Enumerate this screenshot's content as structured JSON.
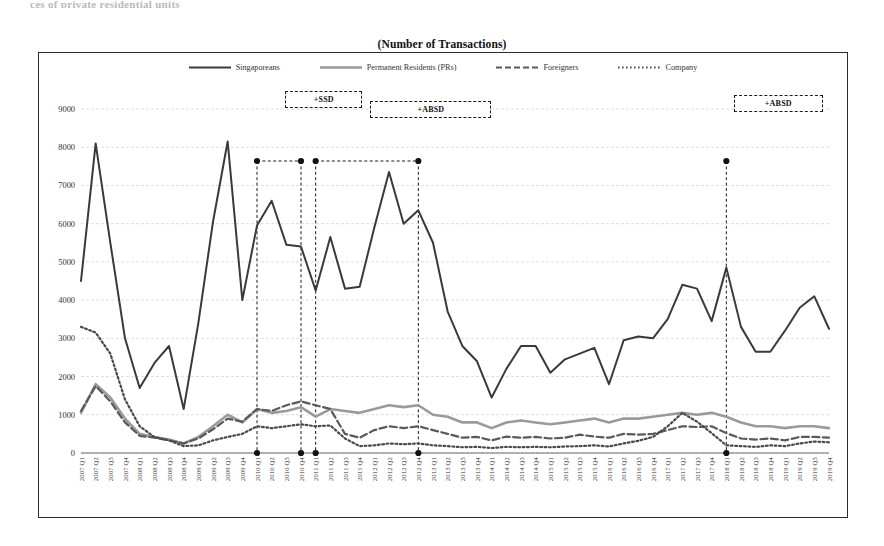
{
  "page": {
    "cut_top_text": "ces of private residential units",
    "title": "(Number of Transactions)"
  },
  "legend": [
    {
      "label": "Singaporeans",
      "style": "solid",
      "color": "#3a3a3a",
      "icon": "solid-line-swatch"
    },
    {
      "label": "Permanent Residents (PRs)",
      "style": "solid-light",
      "color": "#9a9a9a",
      "icon": "solid-line-swatch"
    },
    {
      "label": "Foreigners",
      "style": "dashed",
      "color": "#5a5a5a",
      "icon": "dashed-line-swatch"
    },
    {
      "label": "Company",
      "style": "dotted",
      "color": "#4a4a4a",
      "icon": "dotted-line-swatch"
    }
  ],
  "annotations": [
    {
      "label": "+SSD",
      "start_index": 12,
      "end_index": 15,
      "box_left_pct": 30.5,
      "box_width_pct": 9.5,
      "box_top": 38
    },
    {
      "label": "+ABSD",
      "start_index": 16,
      "end_index": 23,
      "box_left_pct": 41.0,
      "box_width_pct": 15.0,
      "box_top": 48
    },
    {
      "label": "+ABSD",
      "start_index": 44,
      "end_index": 44,
      "box_left_pct": 86.0,
      "box_width_pct": 11.0,
      "box_top": 42
    }
  ],
  "chart_data": {
    "type": "line",
    "title": "(Number of Transactions)",
    "xlabel": "",
    "ylabel": "",
    "ylim": [
      0,
      9000
    ],
    "yticks": [
      0,
      1000,
      2000,
      3000,
      4000,
      5000,
      6000,
      7000,
      8000,
      9000
    ],
    "grid": true,
    "legend_position": "top",
    "categories": [
      "2007 Q1",
      "2007 Q2",
      "2007 Q3",
      "2007 Q4",
      "2008 Q1",
      "2008 Q2",
      "2008 Q3",
      "2008 Q4",
      "2009 Q1",
      "2009 Q2",
      "2009 Q3",
      "2009 Q4",
      "2010 Q1",
      "2010 Q2",
      "2010 Q3",
      "2010 Q4",
      "2011 Q1",
      "2011 Q2",
      "2011 Q3",
      "2011 Q4",
      "2012 Q1",
      "2012 Q2",
      "2012 Q3",
      "2012 Q4",
      "2013 Q1",
      "2013 Q2",
      "2013 Q3",
      "2013 Q4",
      "2014 Q1",
      "2014 Q2",
      "2014 Q3",
      "2014 Q4",
      "2015 Q1",
      "2015 Q2",
      "2015 Q3",
      "2015 Q4",
      "2016 Q1",
      "2016 Q2",
      "2016 Q3",
      "2016 Q4",
      "2017 Q1",
      "2017 Q2",
      "2017 Q3",
      "2017 Q4",
      "2018 Q1",
      "2018 Q2",
      "2018 Q3",
      "2018 Q4",
      "2019 Q1",
      "2019 Q2",
      "2019 Q3",
      "2019 Q4"
    ],
    "series": [
      {
        "name": "Singaporeans",
        "color": "#3a3a3a",
        "style": "solid",
        "values": [
          4500,
          8100,
          5500,
          3000,
          1700,
          2350,
          2800,
          1150,
          3400,
          6050,
          8150,
          4000,
          5950,
          6600,
          5450,
          5400,
          4250,
          5650,
          4300,
          4350,
          5900,
          7350,
          6000,
          6350,
          5500,
          3700,
          2800,
          2400,
          1450,
          2200,
          2800,
          2800,
          2100,
          2450,
          2600,
          2750,
          1800,
          2950,
          3050,
          3000,
          3500,
          4400,
          4300,
          3450,
          4850,
          3300,
          2650,
          2650,
          3200,
          3800,
          4100,
          3250
        ]
      },
      {
        "name": "Permanent Residents (PRs)",
        "color": "#9a9a9a",
        "style": "solid-light",
        "values": [
          1050,
          1800,
          1450,
          900,
          500,
          420,
          350,
          250,
          420,
          700,
          1000,
          800,
          1150,
          1050,
          1100,
          1200,
          950,
          1150,
          1100,
          1050,
          1150,
          1250,
          1200,
          1250,
          1000,
          950,
          800,
          800,
          650,
          800,
          850,
          800,
          750,
          800,
          850,
          900,
          800,
          900,
          900,
          950,
          1000,
          1050,
          1000,
          1050,
          950,
          800,
          700,
          700,
          650,
          700,
          700,
          650
        ]
      },
      {
        "name": "Foreigners",
        "color": "#5a5a5a",
        "style": "dashed",
        "values": [
          1100,
          1750,
          1350,
          800,
          450,
          400,
          330,
          250,
          380,
          620,
          900,
          820,
          1150,
          1100,
          1250,
          1350,
          1250,
          1150,
          500,
          400,
          600,
          700,
          650,
          700,
          600,
          500,
          400,
          420,
          330,
          430,
          400,
          420,
          380,
          400,
          480,
          430,
          400,
          500,
          480,
          500,
          600,
          700,
          680,
          700,
          520,
          380,
          350,
          380,
          330,
          420,
          420,
          400
        ]
      },
      {
        "name": "Company",
        "color": "#4a4a4a",
        "style": "dotted",
        "values": [
          3300,
          3150,
          2600,
          1400,
          700,
          420,
          330,
          180,
          200,
          330,
          420,
          500,
          700,
          650,
          700,
          750,
          700,
          720,
          380,
          180,
          200,
          250,
          230,
          250,
          200,
          180,
          150,
          160,
          130,
          160,
          150,
          160,
          150,
          170,
          180,
          200,
          170,
          250,
          320,
          420,
          700,
          1050,
          820,
          520,
          200,
          180,
          160,
          200,
          180,
          250,
          300,
          280
        ]
      }
    ]
  }
}
